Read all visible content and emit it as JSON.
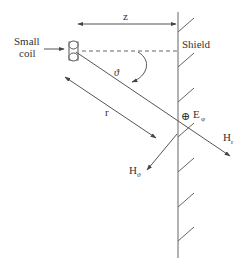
{
  "diagram": {
    "labels": {
      "coil": [
        "Small",
        "coil"
      ],
      "shield": "Shield",
      "distance_z": "z",
      "angle": "ϑ",
      "radius": "r",
      "e_field_symbol": "⊕",
      "e_field": "E",
      "e_field_sub": "φ",
      "h_r": "H",
      "h_r_sub": "r",
      "h_theta": "H",
      "h_theta_sub": "ϑ"
    },
    "colors": {
      "line": "#555555",
      "text": "#333333",
      "background": "#ffffff"
    }
  }
}
